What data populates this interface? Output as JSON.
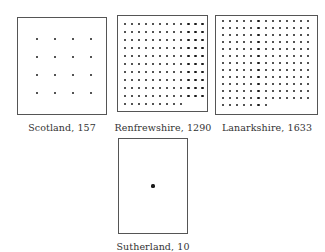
{
  "figure": {
    "panels": [
      {
        "id": "scotland",
        "region": "Scotland",
        "value": "157",
        "label": "Scotland, 157",
        "box": {
          "x": 17,
          "y": 17,
          "w": 90,
          "h": 98
        },
        "grid": {
          "cols": 4,
          "rows": 4,
          "last_row": 4,
          "dx": 18,
          "dy": 18,
          "ox": 19,
          "oy": 21,
          "dot": 2.6
        }
      },
      {
        "id": "renfrewshire",
        "region": "Renfrewshire",
        "value": "1290",
        "label": "Renfrewshire, 1290",
        "box": {
          "x": 117,
          "y": 15,
          "w": 91,
          "h": 97
        },
        "grid": {
          "cols": 12,
          "rows": 11,
          "last_row": 9,
          "dx": 7.05,
          "dy": 8.0,
          "ox": 7,
          "oy": 8,
          "dot": 2.2
        }
      },
      {
        "id": "lanarkshire",
        "region": "Lanarkshire",
        "value": "1633",
        "label": "Lanarkshire, 1633",
        "box": {
          "x": 215,
          "y": 15,
          "w": 103,
          "h": 100
        },
        "grid": {
          "cols": 13,
          "rows": 13,
          "last_row": 7,
          "dx": 7.1,
          "dy": 7.0,
          "ox": 7,
          "oy": 5,
          "dot": 2.2
        }
      },
      {
        "id": "sutherland",
        "region": "Sutherland",
        "value": "10",
        "label": "Sutherland, 10",
        "box": {
          "x": 118,
          "y": 138,
          "w": 70,
          "h": 96
        },
        "grid": {
          "cols": 1,
          "rows": 1,
          "last_row": 1,
          "dx": 0,
          "dy": 0,
          "ox": 34,
          "oy": 47,
          "dot": 3.2
        }
      }
    ],
    "captions": {
      "scotland": {
        "x": 62,
        "y": 122
      },
      "renfrewshire": {
        "x": 163,
        "y": 122
      },
      "lanarkshire": {
        "x": 267,
        "y": 122
      },
      "sutherland": {
        "x": 153,
        "y": 241
      }
    }
  }
}
